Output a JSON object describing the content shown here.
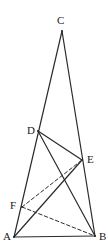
{
  "figure": {
    "stroke_color": "#2b2b2b",
    "background_color": "#ffffff",
    "label_color": "#1a1a1a",
    "vertices": [
      {
        "name": "C",
        "label": "C",
        "x": 62,
        "y": 31,
        "label_x": 57,
        "label_y": 15
      },
      {
        "name": "D",
        "label": "D",
        "x": 38,
        "y": 131,
        "label_x": 27,
        "label_y": 125
      },
      {
        "name": "E",
        "label": "E",
        "x": 82,
        "y": 160,
        "label_x": 87,
        "label_y": 154
      },
      {
        "name": "F",
        "label": "F",
        "x": 22,
        "y": 207,
        "label_x": 10,
        "label_y": 200
      },
      {
        "name": "A",
        "label": "A",
        "x": 14,
        "y": 237,
        "label_x": 3,
        "label_y": 231
      },
      {
        "name": "B",
        "label": "B",
        "x": 95,
        "y": 236,
        "label_x": 99,
        "label_y": 231
      }
    ],
    "solid_segments": [
      {
        "name": "segment-CA",
        "from": "C",
        "to": "A"
      },
      {
        "name": "segment-CB",
        "from": "C",
        "to": "B"
      },
      {
        "name": "segment-AB",
        "from": "A",
        "to": "B"
      },
      {
        "name": "segment-DE",
        "from": "D",
        "to": "E"
      },
      {
        "name": "segment-DB",
        "from": "D",
        "to": "B"
      },
      {
        "name": "segment-AE",
        "from": "A",
        "to": "E"
      }
    ],
    "dashed_segments": [
      {
        "name": "segment-FE-dashed",
        "from": "F",
        "to": "E"
      },
      {
        "name": "segment-FB-dashed",
        "from": "F",
        "to": "B"
      }
    ]
  }
}
